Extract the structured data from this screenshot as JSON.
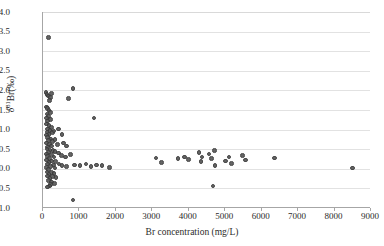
{
  "chart_data": {
    "type": "scatter",
    "title": "",
    "xlabel": "Br  concentration (mg/L)",
    "ylabel_plain": "δ81Br (‰)",
    "ylabel_parts": {
      "delta": "δ",
      "sup": "81",
      "element": "Br",
      "unit": "(‰)"
    },
    "xlim": [
      0,
      9000
    ],
    "ylim": [
      -1.0,
      4.0
    ],
    "xticks": [
      0,
      1000,
      2000,
      3000,
      4000,
      5000,
      6000,
      7000,
      8000,
      9000
    ],
    "xticklabels": [
      "0",
      "1000",
      "2000",
      "3000",
      "4000",
      "5000",
      "6000",
      "7000",
      "8000",
      "9000"
    ],
    "yticks": [
      -1.0,
      -0.5,
      0.0,
      0.5,
      1.0,
      1.5,
      2.0,
      2.5,
      3.0,
      3.5,
      4.0
    ],
    "yticklabels": [
      "-1.0",
      "-0.5",
      "0.0",
      "0.5",
      "1.0",
      "1.5",
      "2.0",
      "2.5",
      "3.0",
      "3.5",
      "4.0"
    ],
    "grid": "horizontal",
    "legend": "none",
    "marker": {
      "shape": "circle",
      "color": "#575757",
      "edge_color": "#3a3a3a",
      "size_px": 4.6
    },
    "series": [
      {
        "name": "samples",
        "points": [
          [
            150,
            3.35
          ],
          [
            80,
            1.95
          ],
          [
            110,
            1.9
          ],
          [
            150,
            1.86
          ],
          [
            200,
            1.82
          ],
          [
            240,
            1.92
          ],
          [
            180,
            1.74
          ],
          [
            700,
            1.8
          ],
          [
            820,
            2.05
          ],
          [
            90,
            1.58
          ],
          [
            130,
            1.54
          ],
          [
            170,
            1.48
          ],
          [
            110,
            1.4
          ],
          [
            210,
            1.44
          ],
          [
            150,
            1.34
          ],
          [
            90,
            1.3
          ],
          [
            200,
            1.26
          ],
          [
            120,
            1.22
          ],
          [
            1400,
            1.3
          ],
          [
            100,
            1.14
          ],
          [
            160,
            1.1
          ],
          [
            230,
            1.06
          ],
          [
            130,
            1.02
          ],
          [
            190,
            0.98
          ],
          [
            110,
            0.94
          ],
          [
            260,
            0.92
          ],
          [
            170,
            0.88
          ],
          [
            90,
            0.86
          ],
          [
            300,
            0.96
          ],
          [
            430,
            1.02
          ],
          [
            520,
            0.88
          ],
          [
            120,
            0.8
          ],
          [
            200,
            0.76
          ],
          [
            150,
            0.72
          ],
          [
            260,
            0.7
          ],
          [
            100,
            0.66
          ],
          [
            330,
            0.74
          ],
          [
            180,
            0.62
          ],
          [
            240,
            0.58
          ],
          [
            120,
            0.56
          ],
          [
            400,
            0.62
          ],
          [
            560,
            0.66
          ],
          [
            650,
            0.58
          ],
          [
            110,
            0.5
          ],
          [
            190,
            0.48
          ],
          [
            270,
            0.46
          ],
          [
            150,
            0.42
          ],
          [
            330,
            0.44
          ],
          [
            90,
            0.38
          ],
          [
            230,
            0.36
          ],
          [
            420,
            0.4
          ],
          [
            130,
            0.32
          ],
          [
            300,
            0.3
          ],
          [
            180,
            0.26
          ],
          [
            500,
            0.34
          ],
          [
            620,
            0.3
          ],
          [
            760,
            0.36
          ],
          [
            100,
            0.22
          ],
          [
            240,
            0.2
          ],
          [
            160,
            0.16
          ],
          [
            350,
            0.18
          ],
          [
            120,
            0.12
          ],
          [
            280,
            0.1
          ],
          [
            200,
            0.06
          ],
          [
            440,
            0.12
          ],
          [
            90,
            0.04
          ],
          [
            330,
            0.02
          ],
          [
            150,
            -0.02
          ],
          [
            520,
            0.08
          ],
          [
            640,
            0.06
          ],
          [
            870,
            0.1
          ],
          [
            1020,
            0.08
          ],
          [
            1180,
            0.12
          ],
          [
            1320,
            0.06
          ],
          [
            1460,
            0.1
          ],
          [
            1620,
            0.08
          ],
          [
            1820,
            0.04
          ],
          [
            110,
            -0.08
          ],
          [
            230,
            -0.1
          ],
          [
            170,
            -0.14
          ],
          [
            300,
            -0.12
          ],
          [
            130,
            -0.18
          ],
          [
            260,
            -0.2
          ],
          [
            190,
            -0.24
          ],
          [
            360,
            -0.22
          ],
          [
            150,
            -0.3
          ],
          [
            240,
            -0.34
          ],
          [
            200,
            -0.4
          ],
          [
            310,
            -0.38
          ],
          [
            180,
            -0.44
          ],
          [
            120,
            -0.46
          ],
          [
            820,
            -0.8
          ],
          [
            3100,
            0.28
          ],
          [
            3250,
            0.16
          ],
          [
            3700,
            0.26
          ],
          [
            3880,
            0.3
          ],
          [
            4000,
            0.24
          ],
          [
            4280,
            0.42
          ],
          [
            4360,
            0.3
          ],
          [
            4340,
            0.18
          ],
          [
            4560,
            0.38
          ],
          [
            4620,
            0.26
          ],
          [
            4700,
            0.46
          ],
          [
            4720,
            0.08
          ],
          [
            4660,
            -0.44
          ],
          [
            5000,
            0.2
          ],
          [
            5100,
            0.3
          ],
          [
            5180,
            0.14
          ],
          [
            5480,
            0.34
          ],
          [
            5560,
            0.22
          ],
          [
            6350,
            0.28
          ],
          [
            8500,
            0.02
          ]
        ]
      }
    ]
  }
}
